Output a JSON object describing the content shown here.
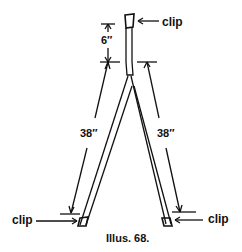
{
  "labels": {
    "clip_top": "clip",
    "clip_left": "clip",
    "clip_right": "clip",
    "dim_top": "6″",
    "dim_left": "38″",
    "dim_right": "38″",
    "caption": "Illus. 68."
  },
  "colors": {
    "line": "#111111",
    "background": "#ffffff"
  }
}
